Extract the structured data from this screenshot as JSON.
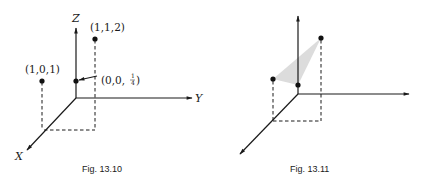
{
  "figures": [
    {
      "caption": "Fig. 13.10",
      "axes": {
        "x": "X",
        "y": "Y",
        "z": "Z"
      },
      "points": [
        {
          "label_prefix": "(1,1,2)",
          "coords": [
            1,
            1,
            2
          ]
        },
        {
          "label_prefix": "(1,0,1)",
          "coords": [
            1,
            0,
            1
          ]
        },
        {
          "label_prefix": "(0,0,",
          "label_frac_num": "1",
          "label_frac_den": "4",
          "label_suffix": ")",
          "coords": [
            0,
            0,
            0.25
          ]
        }
      ]
    },
    {
      "caption": "Fig. 13.11",
      "points": [
        {
          "coords": [
            1,
            0,
            1
          ]
        },
        {
          "coords": [
            1,
            1,
            2
          ]
        },
        {
          "coords": [
            0,
            0,
            0.25
          ]
        }
      ],
      "shaded_region": "triangle through the three points",
      "shade_color": "#d9d9d9"
    }
  ]
}
